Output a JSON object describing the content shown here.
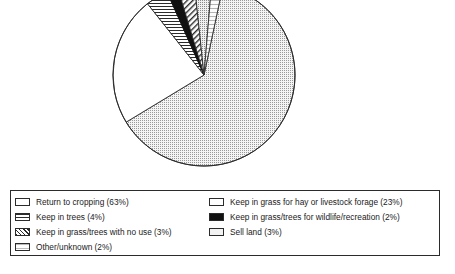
{
  "chart_data": {
    "type": "pie",
    "title": "",
    "subtitle": "",
    "xlabel": "",
    "ylabel": "",
    "legend_position": "bottom",
    "grid": false,
    "units": "percent",
    "start_angle_deg": 12,
    "direction": "clockwise",
    "categories": [
      "Return to cropping",
      "Keep in grass for hay or livestock forage",
      "Keep in trees",
      "Keep in grass/trees for wildlife/recreation",
      "Keep in grass/trees with no use",
      "Sell land",
      "Other/unknown"
    ],
    "values": [
      63,
      23,
      4,
      2,
      3,
      3,
      2
    ],
    "slices": [
      {
        "label": "Return to cropping",
        "value": 63,
        "value_text": "63%",
        "pattern": "fine-dot-stipple",
        "fill": "#f2f2f2",
        "stroke": "#2b2b2b"
      },
      {
        "label": "Keep in grass for hay or livestock forage",
        "value": 23,
        "value_text": "23%",
        "pattern": "solid-white",
        "fill": "#ffffff",
        "stroke": "#2b2b2b"
      },
      {
        "label": "Keep in trees",
        "value": 4,
        "value_text": "4%",
        "pattern": "horizontal-lines",
        "fill": "#ffffff",
        "stroke": "#2b2b2b"
      },
      {
        "label": "Keep in grass/trees for wildlife/recreation",
        "value": 2,
        "value_text": "2%",
        "pattern": "solid-black",
        "fill": "#111111",
        "stroke": "#111111"
      },
      {
        "label": "Keep in grass/trees with no use",
        "value": 3,
        "value_text": "3%",
        "pattern": "diagonal-hatch",
        "fill": "#ffffff",
        "stroke": "#2b2b2b"
      },
      {
        "label": "Sell land",
        "value": 3,
        "value_text": "3%",
        "pattern": "fine-dot-stipple",
        "fill": "#ededed",
        "stroke": "#2b2b2b"
      },
      {
        "label": "Other/unknown",
        "value": 2,
        "value_text": "2%",
        "pattern": "light-horizontal-lines",
        "fill": "#fafafa",
        "stroke": "#2b2b2b"
      }
    ]
  },
  "legend": {
    "columns": [
      {
        "items": [
          {
            "swatch": "empty",
            "label": "Return to cropping (63%)"
          },
          {
            "swatch": "hlines",
            "label": "Keep in trees (4%)"
          },
          {
            "swatch": "diag",
            "label": "Keep in grass/trees with no use (3%)"
          },
          {
            "swatch": "light",
            "label": "Other/unknown (2%)"
          }
        ]
      },
      {
        "items": [
          {
            "swatch": "empty",
            "label": "Keep in grass for hay or livestock forage (23%)"
          },
          {
            "swatch": "solid",
            "label": "Keep in grass/trees for wildlife/recreation (2%)"
          },
          {
            "swatch": "dots",
            "label": "Sell land (3%)"
          }
        ]
      }
    ]
  },
  "colors": {
    "outline": "#2b2b2b",
    "black_slice": "#111111",
    "light_slice": "#f2f2f2",
    "white_slice": "#ffffff",
    "background": "#ffffff"
  }
}
